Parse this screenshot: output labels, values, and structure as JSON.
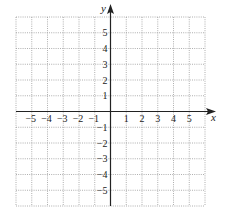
{
  "chart_data": {
    "type": "coordinate-grid",
    "title": "",
    "xlabel": "x",
    "ylabel": "y",
    "xlim": [
      -6,
      6
    ],
    "ylim": [
      -6,
      6
    ],
    "grid": true,
    "grid_style": "dotted",
    "x_ticks": [
      -5,
      -4,
      -3,
      -2,
      -1,
      1,
      2,
      3,
      4,
      5
    ],
    "y_ticks": [
      5,
      4,
      3,
      2,
      1,
      -1,
      -2,
      -3,
      -4,
      -5
    ],
    "x_tick_labels": [
      "−5",
      "−4",
      "−3",
      "−2",
      "−1",
      "1",
      "2",
      "3",
      "4",
      "5"
    ],
    "y_tick_labels": [
      "5",
      "4",
      "3",
      "2",
      "1",
      "−1",
      "−2",
      "−3",
      "−4",
      "−5"
    ],
    "series": []
  },
  "axes": {
    "x_label": "x",
    "y_label": "y"
  }
}
